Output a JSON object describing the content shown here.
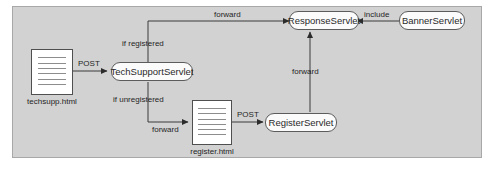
{
  "diagram": {
    "panel": {
      "background": "#d2d2d2",
      "border_color": "#a8a8a8"
    },
    "nodes": [
      {
        "id": "techsupp_html",
        "type": "document",
        "label": "techsupp.html",
        "icon": "document-icon"
      },
      {
        "id": "tech_support_servlet",
        "type": "servlet",
        "label": "TechSupportServlet"
      },
      {
        "id": "response_servlet",
        "type": "servlet",
        "label": "ResponseServlet"
      },
      {
        "id": "banner_servlet",
        "type": "servlet",
        "label": "BannerServlet"
      },
      {
        "id": "register_html",
        "type": "document",
        "label": "register.html",
        "icon": "document-icon"
      },
      {
        "id": "register_servlet",
        "type": "servlet",
        "label": "RegisterServlet"
      }
    ],
    "edges": [
      {
        "id": "e1",
        "from": "techsupp_html",
        "to": "tech_support_servlet",
        "label": "POST"
      },
      {
        "id": "e2",
        "from": "tech_support_servlet",
        "to": "response_servlet",
        "label": "forward"
      },
      {
        "id": "e3",
        "from": "tech_support_servlet",
        "to": "response_servlet",
        "label": "if registered"
      },
      {
        "id": "e4",
        "from": "tech_support_servlet",
        "to": "register_html",
        "label": "if unregistered"
      },
      {
        "id": "e5",
        "from": "tech_support_servlet",
        "to": "register_html",
        "label": "forward"
      },
      {
        "id": "e6",
        "from": "register_html",
        "to": "register_servlet",
        "label": "POST"
      },
      {
        "id": "e7",
        "from": "register_servlet",
        "to": "response_servlet",
        "label": "forward"
      },
      {
        "id": "e8",
        "from": "banner_servlet",
        "to": "response_servlet",
        "label": "include"
      }
    ],
    "labels": {
      "post_top": "POST",
      "forward_top": "forward",
      "if_registered": "if registered",
      "if_unregistered": "if unregistered",
      "forward_bottom_left": "forward",
      "post_bottom": "POST",
      "forward_vertical": "forward",
      "include": "include"
    },
    "colors": {
      "panel_bg": "#d2d2d2",
      "node_fill": "#fbfbfb",
      "node_stroke": "#5c5c5c",
      "edge_stroke": "#3a3a3a",
      "doc_fill": "#ffffff",
      "text": "#1f1f1f"
    }
  }
}
